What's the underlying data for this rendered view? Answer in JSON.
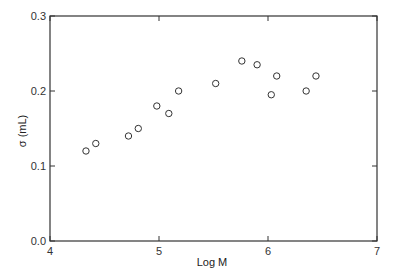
{
  "chart_data": {
    "type": "scatter",
    "title": "",
    "xlabel": "Log M",
    "ylabel": "σ (mL)",
    "xlim": [
      4,
      7
    ],
    "ylim": [
      0.0,
      0.3
    ],
    "x_ticks": [
      4,
      5,
      6,
      7
    ],
    "x_tick_labels": [
      "4",
      "5",
      "6",
      "7"
    ],
    "y_ticks": [
      0.0,
      0.1,
      0.2,
      0.3
    ],
    "y_tick_labels": [
      "0.0",
      "0.1",
      "0.2",
      "0.3"
    ],
    "grid": false,
    "legend": null,
    "marker": "open-circle",
    "series": [
      {
        "name": "data",
        "points": [
          {
            "x": 4.33,
            "y": 0.12
          },
          {
            "x": 4.42,
            "y": 0.13
          },
          {
            "x": 4.72,
            "y": 0.14
          },
          {
            "x": 4.81,
            "y": 0.15
          },
          {
            "x": 4.98,
            "y": 0.18
          },
          {
            "x": 5.09,
            "y": 0.17
          },
          {
            "x": 5.18,
            "y": 0.2
          },
          {
            "x": 5.52,
            "y": 0.21
          },
          {
            "x": 5.76,
            "y": 0.24
          },
          {
            "x": 5.9,
            "y": 0.235
          },
          {
            "x": 6.03,
            "y": 0.195
          },
          {
            "x": 6.08,
            "y": 0.22
          },
          {
            "x": 6.35,
            "y": 0.2
          },
          {
            "x": 6.44,
            "y": 0.22
          }
        ]
      }
    ]
  },
  "colors": {
    "axis": "#333333",
    "marker_stroke": "#333333",
    "background": "#ffffff"
  }
}
